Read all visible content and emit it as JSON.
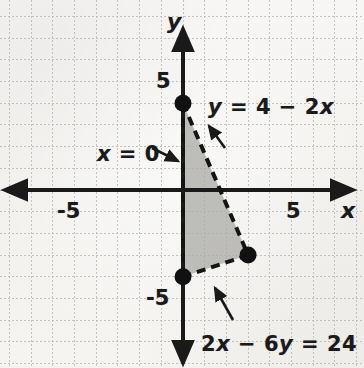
{
  "figure": {
    "kind": "coordinate-graph",
    "background_color": "#f4f3f0",
    "ink_color": "#1a1a1a",
    "grid_color": "#b9b9b5",
    "shade_color": "#a9a9a6"
  },
  "axes": {
    "x_axis_label": "x",
    "y_axis_label": "y",
    "origin_px": {
      "x": 183,
      "y": 190
    },
    "unit_px": 21.7,
    "xlim": [
      -8.4,
      8.3
    ],
    "ylim": [
      -8.2,
      8.7
    ],
    "grid": "dotted",
    "ticks": {
      "x": [
        {
          "value": -5,
          "label": "-5",
          "px_x": 74
        },
        {
          "value": 5,
          "label": "5",
          "px_x": 292
        }
      ],
      "y": [
        {
          "value": 5,
          "label": "5",
          "px_y": 82
        },
        {
          "value": -5,
          "label": "-5",
          "px_y": 299
        }
      ]
    }
  },
  "chart_data": {
    "type": "scatter",
    "title": "",
    "xlabel": "x",
    "ylabel": "y",
    "xlim": [
      -8.4,
      8.3
    ],
    "ylim": [
      -8.2,
      8.7
    ],
    "grid": true,
    "legend": "none",
    "shaded_region": {
      "name": "feasible-region",
      "fill": "#a9a9a6",
      "opacity": 0.75,
      "border": "dashed",
      "vertices": [
        {
          "x": 0,
          "y": 4
        },
        {
          "x": 3,
          "y": -3
        },
        {
          "x": 0,
          "y": -4
        }
      ]
    },
    "boundary_lines": [
      {
        "name": "y = 4 - 2x",
        "label": "y = 4 − 2x",
        "style": "dashed",
        "from": {
          "x": 0,
          "y": 4
        },
        "to": {
          "x": 3,
          "y": -3
        }
      },
      {
        "name": "2x - 6y = 24",
        "label": "2x − 6y = 24",
        "style": "dashed",
        "from": {
          "x": 3,
          "y": -3
        },
        "to": {
          "x": 0,
          "y": -4
        }
      },
      {
        "name": "x = 0",
        "label": "x = 0",
        "style": "dashed",
        "from": {
          "x": 0,
          "y": 4
        },
        "to": {
          "x": 0,
          "y": -4
        }
      }
    ],
    "points": [
      {
        "label": "",
        "x": 0,
        "y": 4,
        "marker": "filled-circle"
      },
      {
        "label": "",
        "x": 3,
        "y": -3,
        "marker": "filled-circle"
      },
      {
        "label": "",
        "x": 0,
        "y": -4,
        "marker": "filled-circle"
      }
    ]
  },
  "annotations": {
    "line_eq_top": {
      "text": "y = 4 − 2x",
      "lhs": "y",
      "op1": " = 4 − 2",
      "rhs": "x",
      "px": {
        "x": 208,
        "y": 97
      },
      "leader_from": {
        "x": 225,
        "y": 148
      },
      "leader_to": {
        "x": 209,
        "y": 126
      }
    },
    "line_eq_left": {
      "text": "x = 0",
      "lhs": "x",
      "op1": " = 0",
      "px": {
        "x": 97,
        "y": 144
      },
      "leader_from": {
        "x": 152,
        "y": 148
      },
      "leader_to": {
        "x": 178,
        "y": 161
      }
    },
    "line_eq_bottom": {
      "text": "2x − 6y = 24",
      "prefix": "2",
      "v1": "x",
      "mid": " − 6",
      "v2": "y",
      "suffix": " = 24",
      "px": {
        "x": 201,
        "y": 334
      },
      "leader_from": {
        "x": 233,
        "y": 320
      },
      "leader_to": {
        "x": 215,
        "y": 288
      }
    }
  }
}
